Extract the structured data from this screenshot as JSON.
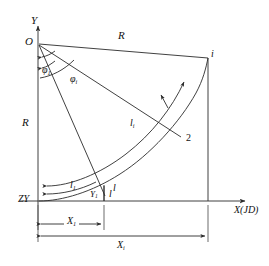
{
  "figure": {
    "type": "engineering-geometry-diagram",
    "stroke_color": "#2b2b2b",
    "background_color": "#ffffff",
    "width": 269,
    "height": 266
  },
  "axes": {
    "y_axis": {
      "label": "Y",
      "name": "vertical-axis"
    },
    "x_axis": {
      "label": "X(JD)",
      "name": "horizontal-axis"
    }
  },
  "points": {
    "origin": {
      "label": "O",
      "x": 38,
      "y": 44
    },
    "curve_start": {
      "label": "ZY",
      "x": 38,
      "y": 201
    },
    "point_1": {
      "label": "l",
      "x": 104,
      "y": 193
    },
    "point_2": {
      "label": "2",
      "x": 180,
      "y": 139
    },
    "point_i": {
      "label": "i",
      "x": 208,
      "y": 58
    }
  },
  "radii": {
    "chord_top": "R",
    "axis_left": "R"
  },
  "angles": {
    "phi_1": {
      "base": "φ",
      "sub": "1"
    },
    "phi_i": {
      "base": "φ",
      "sub": "i"
    }
  },
  "arcs": {
    "l_1": {
      "base": "l",
      "sub": "1"
    },
    "l_i": {
      "base": "l",
      "sub": "i"
    },
    "l": {
      "base": "l",
      "sub": ""
    }
  },
  "dimensions": {
    "x_1": {
      "base": "X",
      "sub": "1"
    },
    "x_i": {
      "base": "X",
      "sub": "i"
    },
    "y_1": {
      "base": "Y",
      "sub": "1"
    }
  }
}
